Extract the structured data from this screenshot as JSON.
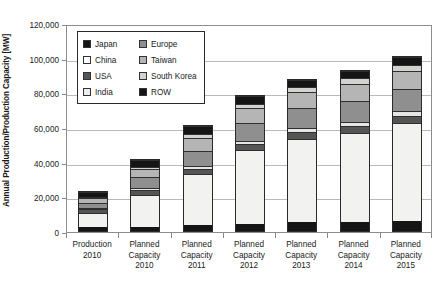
{
  "chart_data": {
    "type": "bar",
    "subtype": "stacked-vertical",
    "title": "",
    "xlabel": "",
    "ylabel": "Annual Production/Production Capacity [MW]",
    "ylim": [
      0,
      120000
    ],
    "ytick_values": [
      0,
      20000,
      40000,
      60000,
      80000,
      100000,
      120000
    ],
    "ytick_labels": [
      "0",
      "20,000",
      "40,000",
      "60,000",
      "80,000",
      "100,000",
      "120,000"
    ],
    "grid": true,
    "grid_axis": "y",
    "legend_position": "upper-left-inside",
    "categories": [
      "Production 2010",
      "Planned Capacity 2010",
      "Planned Capacity 2011",
      "Planned Capacity 2012",
      "Planned Capacity 2013",
      "Planned Capacity 2014",
      "Planned Capacity 2015"
    ],
    "category_lines": [
      [
        "Production",
        "2010"
      ],
      [
        "Planned",
        "Capacity",
        "2010"
      ],
      [
        "Planned",
        "Capacity",
        "2011"
      ],
      [
        "Planned",
        "Capacity",
        "2012"
      ],
      [
        "Planned",
        "Capacity",
        "2013"
      ],
      [
        "Planned",
        "Capacity",
        "2014"
      ],
      [
        "Planned",
        "Capacity",
        "2015"
      ]
    ],
    "series": [
      {
        "name": "Japan",
        "color": "#151515",
        "values": [
          2200,
          2600,
          3500,
          4200,
          5000,
          5300,
          5500
        ]
      },
      {
        "name": "China",
        "color": "#f2f2f0",
        "values": [
          9000,
          19000,
          30000,
          43000,
          49000,
          52000,
          57000
        ]
      },
      {
        "name": "USA",
        "color": "#555555",
        "values": [
          2000,
          2600,
          3200,
          3600,
          3900,
          4000,
          4100
        ]
      },
      {
        "name": "India",
        "color": "#e6e6e4",
        "values": [
          700,
          1100,
          1600,
          2000,
          2300,
          2400,
          2500
        ]
      },
      {
        "name": "Europe",
        "color": "#8f8f8f",
        "values": [
          3100,
          6500,
          9000,
          10500,
          11500,
          12500,
          13000
        ]
      },
      {
        "name": "Taiwan",
        "color": "#b5b5b5",
        "values": [
          3200,
          5200,
          7500,
          8500,
          9500,
          9800,
          10200
        ]
      },
      {
        "name": "South Korea",
        "color": "#d2d2d0",
        "values": [
          600,
          1200,
          2200,
          2700,
          3200,
          3500,
          3700
        ]
      },
      {
        "name": "ROW",
        "color": "#151515",
        "values": [
          2700,
          3800,
          5000,
          4500,
          4100,
          4000,
          4500
        ]
      }
    ],
    "bar_totals": [
      23500,
      42000,
      62000,
      79000,
      88500,
      93500,
      101500
    ]
  },
  "legend": {
    "entries": [
      {
        "label": "Japan",
        "swatch": "legend-swatch-japan",
        "color": "#151515"
      },
      {
        "label": "Europe",
        "swatch": "legend-swatch-europe",
        "color": "#8f8f8f"
      },
      {
        "label": "China",
        "swatch": "legend-swatch-china",
        "color": "#ffffff"
      },
      {
        "label": "Taiwan",
        "swatch": "legend-swatch-taiwan",
        "color": "#b5b5b5"
      },
      {
        "label": "USA",
        "swatch": "legend-swatch-usa",
        "color": "#555555"
      },
      {
        "label": "South Korea",
        "swatch": "legend-swatch-south-korea",
        "color": "#d2d2d0"
      },
      {
        "label": "India",
        "swatch": "legend-swatch-india",
        "color": "#ededeb"
      },
      {
        "label": "ROW",
        "swatch": "legend-swatch-row",
        "color": "#151515"
      }
    ]
  }
}
